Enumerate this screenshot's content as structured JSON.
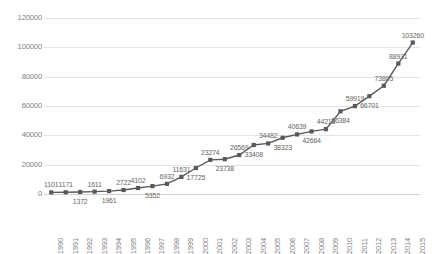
{
  "chart_data": {
    "type": "line",
    "title": "",
    "subtitle": "",
    "xlabel": "",
    "ylabel": "",
    "grid": true,
    "legend": false,
    "marker": "square",
    "line_color": "#595959",
    "marker_color": "#595959",
    "data_labels": true,
    "ylim": [
      0,
      120000
    ],
    "yticks": [
      0,
      20000,
      40000,
      60000,
      80000,
      100000,
      120000
    ],
    "ytick_labels": [
      "0",
      "20000",
      "40000",
      "60000",
      "80000",
      "100000",
      "120000"
    ],
    "categories": [
      "1990",
      "1991",
      "1992",
      "1993",
      "1994",
      "1995",
      "1996",
      "1997",
      "1998",
      "1999",
      "2000",
      "2001",
      "2002",
      "2003",
      "2004",
      "2005",
      "2006",
      "2007",
      "2008",
      "2009",
      "2010",
      "2011",
      "2012",
      "2013",
      "2014",
      "2015"
    ],
    "values": [
      1101,
      1171,
      1372,
      1611,
      1961,
      2722,
      4102,
      5352,
      6932,
      11631,
      17725,
      23274,
      23738,
      26569,
      33408,
      34482,
      38323,
      40639,
      42664,
      44213,
      56384,
      59919,
      66701,
      73805,
      88931,
      103260
    ],
    "label_positions": [
      "above",
      "above",
      "below",
      "above",
      "below",
      "above",
      "above",
      "below",
      "above",
      "above",
      "below",
      "above",
      "below",
      "above",
      "below",
      "above",
      "below",
      "above",
      "below",
      "above",
      "below",
      "above",
      "below",
      "above",
      "above",
      "above"
    ]
  },
  "axis": {
    "y_label_color": "#808080",
    "x_label_color": "#808080",
    "grid_color": "#e3e3e3"
  }
}
